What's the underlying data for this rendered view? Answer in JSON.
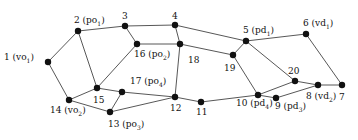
{
  "diagram": {
    "type": "graph",
    "nodes": [
      {
        "id": "1",
        "label": "1",
        "tag": "vo",
        "sub": "1",
        "x": 48,
        "y": 62,
        "lx": 4,
        "ly": 53
      },
      {
        "id": "2",
        "label": "2",
        "tag": "po",
        "sub": "1",
        "x": 78,
        "y": 31,
        "lx": 74,
        "ly": 16
      },
      {
        "id": "3",
        "label": "3",
        "tag": "",
        "sub": "",
        "x": 125,
        "y": 26,
        "lx": 122,
        "ly": 12
      },
      {
        "id": "4",
        "label": "4",
        "tag": "",
        "sub": "",
        "x": 175,
        "y": 25,
        "lx": 172,
        "ly": 12
      },
      {
        "id": "5",
        "label": "5",
        "tag": "pd",
        "sub": "1",
        "x": 246,
        "y": 41,
        "lx": 243,
        "ly": 26
      },
      {
        "id": "6",
        "label": "6",
        "tag": "vd",
        "sub": "1",
        "x": 306,
        "y": 34,
        "lx": 303,
        "ly": 19
      },
      {
        "id": "7",
        "label": "7",
        "tag": "",
        "sub": "",
        "x": 342,
        "y": 85,
        "lx": 339,
        "ly": 93
      },
      {
        "id": "8",
        "label": "8",
        "tag": "vd",
        "sub": "2",
        "x": 318,
        "y": 85,
        "lx": 306,
        "ly": 92
      },
      {
        "id": "9",
        "label": "9",
        "tag": "pd",
        "sub": "3",
        "x": 276,
        "y": 98,
        "lx": 275,
        "ly": 102
      },
      {
        "id": "10",
        "label": "10",
        "tag": "pd",
        "sub": "4",
        "x": 258,
        "y": 95,
        "lx": 236,
        "ly": 99
      },
      {
        "id": "11",
        "label": "11",
        "tag": "",
        "sub": "",
        "x": 201,
        "y": 102,
        "lx": 196,
        "ly": 108
      },
      {
        "id": "12",
        "label": "12",
        "tag": "",
        "sub": "",
        "x": 175,
        "y": 97,
        "lx": 170,
        "ly": 104
      },
      {
        "id": "13",
        "label": "13",
        "tag": "po",
        "sub": "3",
        "x": 110,
        "y": 112,
        "lx": 108,
        "ly": 120
      },
      {
        "id": "14",
        "label": "14",
        "tag": "vo",
        "sub": "2",
        "x": 69,
        "y": 100,
        "lx": 50,
        "ly": 106
      },
      {
        "id": "15",
        "label": "15",
        "tag": "",
        "sub": "",
        "x": 97,
        "y": 88,
        "lx": 93,
        "ly": 96
      },
      {
        "id": "16",
        "label": "16",
        "tag": "po",
        "sub": "2",
        "x": 137,
        "y": 44,
        "lx": 134,
        "ly": 50
      },
      {
        "id": "17",
        "label": "17",
        "tag": "po",
        "sub": "4",
        "x": 122,
        "y": 92,
        "lx": 130,
        "ly": 77
      },
      {
        "id": "18",
        "label": "18",
        "tag": "",
        "sub": "",
        "x": 180,
        "y": 44,
        "lx": 188,
        "ly": 56
      },
      {
        "id": "19",
        "label": "19",
        "tag": "",
        "sub": "",
        "x": 233,
        "y": 55,
        "lx": 224,
        "ly": 64
      },
      {
        "id": "20",
        "label": "20",
        "tag": "",
        "sub": "",
        "x": 295,
        "y": 81,
        "lx": 288,
        "ly": 67
      }
    ],
    "edges": [
      [
        "1",
        "2"
      ],
      [
        "1",
        "14"
      ],
      [
        "2",
        "3"
      ],
      [
        "2",
        "15"
      ],
      [
        "3",
        "4"
      ],
      [
        "3",
        "16"
      ],
      [
        "4",
        "5"
      ],
      [
        "4",
        "18"
      ],
      [
        "16",
        "18"
      ],
      [
        "15",
        "16"
      ],
      [
        "18",
        "19"
      ],
      [
        "19",
        "5"
      ],
      [
        "5",
        "6"
      ],
      [
        "5",
        "20"
      ],
      [
        "6",
        "7"
      ],
      [
        "19",
        "10"
      ],
      [
        "18",
        "12"
      ],
      [
        "14",
        "15"
      ],
      [
        "15",
        "17"
      ],
      [
        "14",
        "13"
      ],
      [
        "17",
        "13"
      ],
      [
        "17",
        "12"
      ],
      [
        "13",
        "12"
      ],
      [
        "12",
        "11"
      ],
      [
        "11",
        "10"
      ],
      [
        "10",
        "20"
      ],
      [
        "10",
        "9"
      ],
      [
        "9",
        "8"
      ],
      [
        "20",
        "8"
      ],
      [
        "8",
        "7"
      ]
    ],
    "colors": {
      "node": "#111111",
      "edge": "#444444",
      "text": "#111111"
    }
  }
}
